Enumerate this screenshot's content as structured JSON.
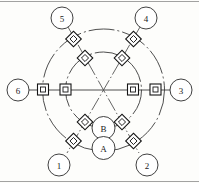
{
  "figure": {
    "kind": "schematic-ring-network-diagram",
    "canvas": {
      "width": 199,
      "height": 183,
      "background": "#fdfdfb"
    },
    "center": {
      "x": 103.5,
      "y": 90
    },
    "rings": [
      {
        "name": "outer-ring",
        "radius": 61,
        "style": "dash-dot",
        "color": "#3a3a3a"
      },
      {
        "name": "inner-ring",
        "radius": 38,
        "style": "dash-dot",
        "color": "#3a3a3a"
      }
    ],
    "terminal_nodes": [
      {
        "id": "node-1",
        "label": "1",
        "cx": 59,
        "cy": 165,
        "r": 11,
        "angle_deg": 240
      },
      {
        "id": "node-2",
        "label": "2",
        "cx": 147,
        "cy": 165,
        "r": 11,
        "angle_deg": 300
      },
      {
        "id": "node-3",
        "label": "3",
        "cx": 181,
        "cy": 90,
        "r": 11,
        "angle_deg": 0
      },
      {
        "id": "node-4",
        "label": "4",
        "cx": 146,
        "cy": 18,
        "r": 11,
        "angle_deg": 60
      },
      {
        "id": "node-5",
        "label": "5",
        "cx": 62,
        "cy": 18,
        "r": 11,
        "angle_deg": 120
      },
      {
        "id": "node-6",
        "label": "6",
        "cx": 18,
        "cy": 90,
        "r": 11,
        "angle_deg": 180
      }
    ],
    "interior_nodes": [
      {
        "id": "node-b",
        "label": "B",
        "cx": 103.5,
        "cy": 128,
        "r": 11.5
      },
      {
        "id": "node-a",
        "label": "A",
        "cx": 103.5,
        "cy": 148,
        "r": 11.5
      }
    ],
    "connectors": {
      "horizontal_style": "square-in-square",
      "diagonal_style": "diamond-in-diamond",
      "outer_ring_count": 6,
      "inner_ring_count": 6,
      "total": 12
    },
    "spokes": [
      {
        "from": "node-1",
        "to": "center",
        "angle_deg": 240
      },
      {
        "from": "node-2",
        "to": "center",
        "angle_deg": 300
      },
      {
        "from": "node-3",
        "to": "center",
        "angle_deg": 0
      },
      {
        "from": "node-4",
        "to": "center",
        "angle_deg": 60
      },
      {
        "from": "node-5",
        "to": "center",
        "angle_deg": 120
      },
      {
        "from": "node-6",
        "to": "center",
        "angle_deg": 180
      }
    ]
  }
}
